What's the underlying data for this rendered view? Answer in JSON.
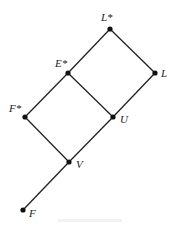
{
  "diagram": {
    "type": "lattice",
    "line_color": "#222222",
    "node_color": "#111111",
    "nodes": [
      {
        "id": "Lstar",
        "label": "L*",
        "x": 110,
        "y": 29,
        "label_x": 101,
        "label_y": 12
      },
      {
        "id": "L",
        "label": "L",
        "x": 155,
        "y": 73,
        "label_x": 161,
        "label_y": 68
      },
      {
        "id": "Estar",
        "label": "E*",
        "x": 68,
        "y": 73,
        "label_x": 55,
        "label_y": 58
      },
      {
        "id": "U",
        "label": "U",
        "x": 113,
        "y": 117,
        "label_x": 120,
        "label_y": 114
      },
      {
        "id": "Fstar",
        "label": "F*",
        "x": 25,
        "y": 117,
        "label_x": 9,
        "label_y": 103
      },
      {
        "id": "V",
        "label": "V",
        "x": 69,
        "y": 162,
        "label_x": 76,
        "label_y": 159
      },
      {
        "id": "F",
        "label": "F",
        "x": 23,
        "y": 210,
        "label_x": 29,
        "label_y": 208
      }
    ],
    "edges": [
      [
        "Lstar",
        "L"
      ],
      [
        "Lstar",
        "Estar"
      ],
      [
        "Estar",
        "U"
      ],
      [
        "L",
        "U"
      ],
      [
        "Estar",
        "Fstar"
      ],
      [
        "Fstar",
        "V"
      ],
      [
        "U",
        "V"
      ],
      [
        "V",
        "F"
      ]
    ]
  }
}
